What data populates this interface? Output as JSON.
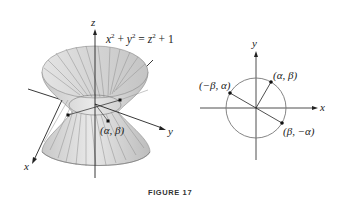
{
  "figure": {
    "caption": "FIGURE 17",
    "left_panel": {
      "equation": {
        "lhs_x": "x",
        "lhs_y": "y",
        "rhs_z": "z",
        "exp": "2",
        "plus": " + ",
        "eq": " = ",
        "one": " + 1"
      },
      "axis_labels": {
        "x": "x",
        "y": "y",
        "z": "z"
      },
      "point_label": "(α, β)"
    },
    "right_panel": {
      "axis_labels": {
        "x": "x",
        "y": "y"
      },
      "points": [
        {
          "label": "(α, β)"
        },
        {
          "label": "(−β, α)"
        },
        {
          "label": "(β, −α)"
        }
      ]
    },
    "colors": {
      "surface": "#d9d9d9",
      "surface_dark": "#a8a8a8",
      "rulings": "#8a8a8a",
      "axis": "#222222",
      "circle": "#777777"
    }
  }
}
